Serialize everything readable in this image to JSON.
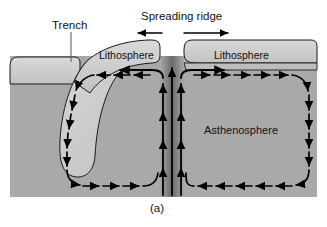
{
  "figure": {
    "caption": "(a)",
    "background_color": "#ffffff"
  },
  "labels": {
    "trench": "Trench",
    "spreading_ridge": "Spreading ridge",
    "lithosphere_left": "Lithosphere",
    "lithosphere_right": "Lithosphere",
    "asthenosphere": "Asthenosphere"
  },
  "colors": {
    "asthenosphere_fill": "#a9a9a9",
    "lithosphere_fill": "#cccccc",
    "slab_fill": "#c9c9c9",
    "upwelling_dark": "#6f6f6f",
    "outline": "#1a1a1a",
    "arrow": "#000000",
    "text": "#111111",
    "page_background": "#ffffff"
  },
  "diagram": {
    "type": "cross-section",
    "features": [
      {
        "name": "trench",
        "label": "Trench",
        "description": "Subduction trench where the left plate descends",
        "leader_line": true
      },
      {
        "name": "spreading-ridge",
        "label": "Spreading ridge",
        "description": "Divergent boundary at center where plates move apart",
        "arrow_directions": [
          "left",
          "right"
        ]
      },
      {
        "name": "lithosphere-left",
        "label": "Lithosphere",
        "description": "Left rigid plate, subducting at the trench"
      },
      {
        "name": "lithosphere-right",
        "label": "Lithosphere",
        "description": "Right rigid plate, moving away from the ridge"
      },
      {
        "name": "asthenosphere",
        "label": "Asthenosphere",
        "description": "Ductile mantle layer hosting convection cells"
      }
    ],
    "convection_cells": [
      {
        "name": "left-convection-cell",
        "rotation": "counterclockwise",
        "style": "dashed",
        "arrow_count": 13
      },
      {
        "name": "right-convection-cell",
        "rotation": "clockwise",
        "style": "dashed",
        "arrow_count": 13
      },
      {
        "name": "central-upwelling",
        "rotation": "upward",
        "style": "solid",
        "arrow_count": 9
      }
    ]
  }
}
